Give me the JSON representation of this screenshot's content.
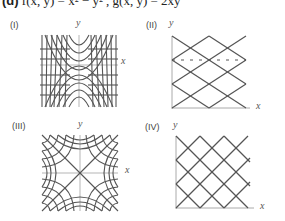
{
  "heading": {
    "part": "(d)",
    "equation": "f(x, y) = x² − y² , g(x, y) = 2xy"
  },
  "panels": [
    {
      "label": "(I)",
      "y_axis": "y",
      "x_axis": "x",
      "description": "parabola-like curves around y-axis (grid)"
    },
    {
      "label": "(II)",
      "y_axis": "y",
      "x_axis": "x",
      "description": "diagonal diamond lattice, first quadrant, dashed horizontal"
    },
    {
      "label": "(III)",
      "y_axis": "y",
      "x_axis": "x",
      "description": "hyperbola grid, symmetric about both axes"
    },
    {
      "label": "(IV)",
      "y_axis": "y",
      "x_axis": "x",
      "description": "diagonal diamond lattice, first quadrant"
    }
  ],
  "colors": {
    "curve": "#555555",
    "axis": "#aaaaaa",
    "text": "#333333"
  }
}
